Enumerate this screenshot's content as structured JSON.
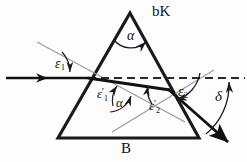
{
  "figure": {
    "labels": {
      "glass_type": "bK",
      "base": "B",
      "apex_angle": "α",
      "inner_apex_angle": "α",
      "incidence_angle": "ε",
      "incidence_sub": "1",
      "internal_refraction_angle": "ε",
      "internal_refraction_sub": "1",
      "internal_refraction_prime": "'",
      "internal_incidence_angle": "ε",
      "internal_incidence_sub": "2",
      "internal_incidence_prime": "'",
      "exit_angle": "ε",
      "exit_sub": "2",
      "deviation_angle": "δ"
    },
    "colors": {
      "prism_outline": "#1a1a1a",
      "ray": "#111111",
      "normal_line": "#8a8a8a",
      "dashed_line": "#2a2a2a",
      "background": "#fdfdfd",
      "label_text": "#111111"
    },
    "geometry": {
      "apex": [
        130,
        13
      ],
      "bottom_left": [
        58,
        138
      ],
      "bottom_right": [
        199,
        138
      ],
      "entry_point": [
        88,
        78
      ],
      "exit_point": [
        168,
        89
      ],
      "incoming_ray_start": [
        8,
        78
      ],
      "outgoing_ray_end": [
        232,
        146
      ],
      "dashed_line_start": [
        88,
        78
      ],
      "dashed_line_end": [
        244,
        78
      ]
    }
  }
}
